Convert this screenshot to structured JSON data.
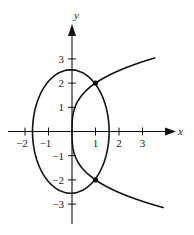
{
  "figure": {
    "x_axis_label": "x",
    "y_axis_label": "y",
    "x_ticks": [
      {
        "value": -2,
        "label": "-2"
      },
      {
        "value": -1,
        "label": "-1"
      },
      {
        "value": 1,
        "label": "1"
      },
      {
        "value": 2,
        "label": "2"
      },
      {
        "value": 3,
        "label": "3"
      }
    ],
    "y_ticks": [
      {
        "value": 3,
        "label": "3"
      },
      {
        "value": 2,
        "label": "2"
      },
      {
        "value": 1,
        "label": "1"
      },
      {
        "value": -1,
        "label": "-1"
      },
      {
        "value": -2,
        "label": "-2"
      },
      {
        "value": -3,
        "label": "-3"
      }
    ],
    "curves": [
      {
        "name": "ellipse",
        "description": "closed oval centered at origin, x-intercepts ~±1.7, y-intercepts ~±2.5"
      },
      {
        "name": "cusp-curve",
        "description": "curve through origin opening right, passing through (1, 2) and (1, -2)"
      }
    ],
    "intersection_points": [
      {
        "x": 1,
        "y": 2
      },
      {
        "x": 1,
        "y": -2
      }
    ],
    "stroke_color": "#111111"
  }
}
